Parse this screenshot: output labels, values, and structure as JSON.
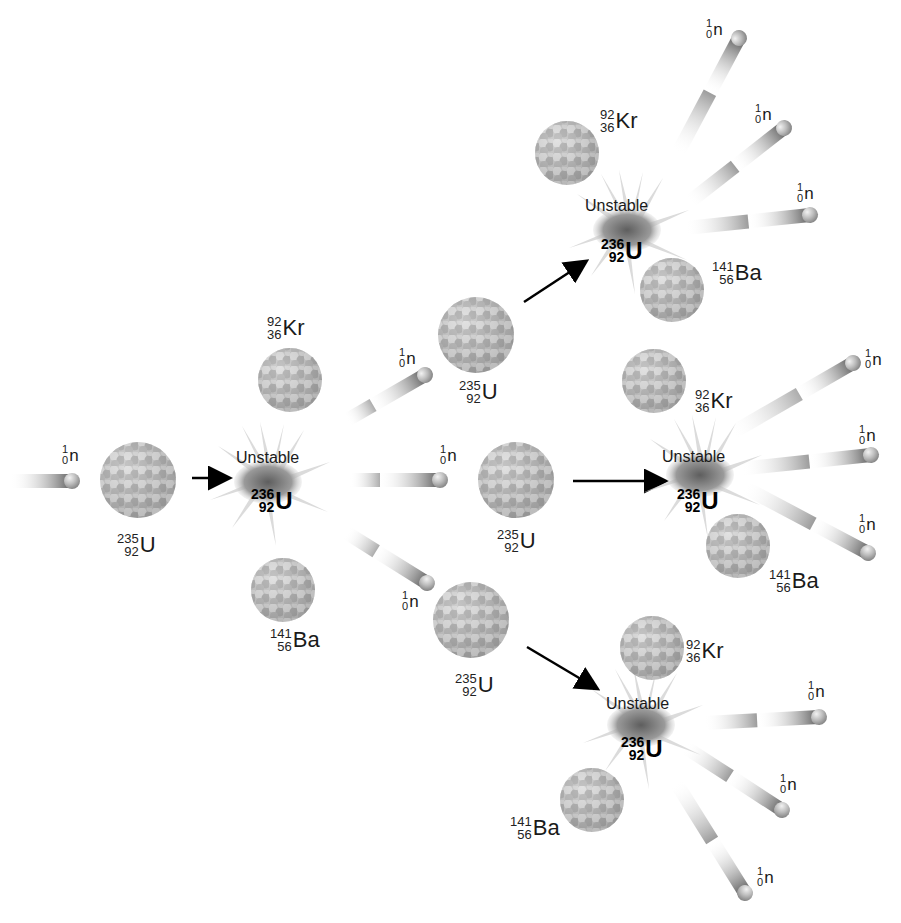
{
  "diagram": {
    "labels": {
      "unstable": "Unstable",
      "neutron": {
        "mass": "1",
        "atomic": "0",
        "symbol": "n"
      },
      "uranium235": {
        "mass": "235",
        "atomic": "92",
        "symbol": "U"
      },
      "uranium236": {
        "mass": "236",
        "atomic": "92",
        "symbol": "U"
      },
      "krypton92": {
        "mass": "92",
        "atomic": "36",
        "symbol": "Kr"
      },
      "barium141": {
        "mass": "141",
        "atomic": "56",
        "symbol": "Ba"
      }
    },
    "colors": {
      "background": "#ffffff",
      "nucleus_light": "#d6d6d6",
      "nucleus_dark": "#8c8c8c",
      "burst": "#6e6e6e",
      "arrow": "#000000",
      "text": "#1a1a1a"
    },
    "stages": [
      {
        "stage": 1,
        "incoming_neutron": {
          "x": 70,
          "y": 481
        },
        "target": {
          "label": "235/92 U",
          "x": 138,
          "y": 480
        },
        "unstable": {
          "label": "236/92 U",
          "x": 270,
          "y": 482
        },
        "products": [
          "92/36 Kr",
          "141/56 Ba",
          "1/0 n",
          "1/0 n",
          "1/0 n"
        ]
      },
      {
        "stage": 2,
        "branches": [
          {
            "target": "235/92 U",
            "unstable": "236/92 U",
            "products": [
              "92/36 Kr",
              "141/56 Ba",
              "1/0 n",
              "1/0 n",
              "1/0 n"
            ]
          },
          {
            "target": "235/92 U",
            "unstable": "236/92 U",
            "products": [
              "92/36 Kr",
              "141/56 Ba",
              "1/0 n",
              "1/0 n",
              "1/0 n"
            ]
          },
          {
            "target": "235/92 U",
            "unstable": "236/92 U",
            "products": [
              "92/36 Kr",
              "141/56 Ba",
              "1/0 n",
              "1/0 n",
              "1/0 n"
            ]
          }
        ]
      }
    ]
  }
}
